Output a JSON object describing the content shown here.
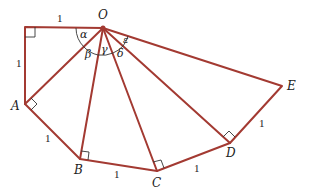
{
  "diagram": {
    "stroke_color": "#a33a32",
    "label_color": "#222222",
    "points": {
      "corner": [
        25,
        27
      ],
      "O": [
        103,
        28
      ],
      "A": [
        25,
        104
      ],
      "B": [
        80,
        159
      ],
      "C": [
        157,
        171
      ],
      "D": [
        230,
        143
      ],
      "E": [
        282,
        86
      ]
    },
    "vertex_labels": {
      "O": "O",
      "A": "A",
      "B": "B",
      "C": "C",
      "D": "D",
      "E": "E"
    },
    "side_labels": {
      "top": "1",
      "left": "1",
      "AB": "1",
      "BC": "1",
      "CD": "1",
      "DE": "1"
    },
    "angle_labels": {
      "alpha": "α",
      "beta": "β",
      "gamma": "γ",
      "delta": "δ",
      "epsilon": "ε"
    },
    "right_angle_markers": [
      "corner",
      "A",
      "B",
      "C",
      "D"
    ]
  }
}
